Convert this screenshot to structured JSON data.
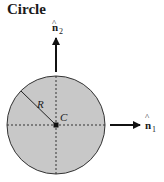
{
  "title": "Circle",
  "labels": {
    "radius": "R",
    "center": "C",
    "n1": "n",
    "n1_sub": "1",
    "n2": "n",
    "n2_sub": "2",
    "hat": "^"
  },
  "colors": {
    "fill": "#c8c8c8",
    "stroke": "#333333",
    "text": "#1a1a1a"
  }
}
